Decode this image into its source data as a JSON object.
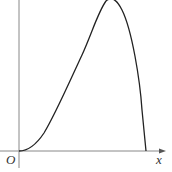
{
  "diagram": {
    "type": "function-graph",
    "origin_label": "O",
    "x_axis_label": "x",
    "colors": {
      "axis": "#888888",
      "curve": "#222222",
      "label": "#333333"
    },
    "curve_description": "Curve starts at origin with zero slope, rises to a maximum near the top, then drops steeply to meet the x-axis."
  }
}
